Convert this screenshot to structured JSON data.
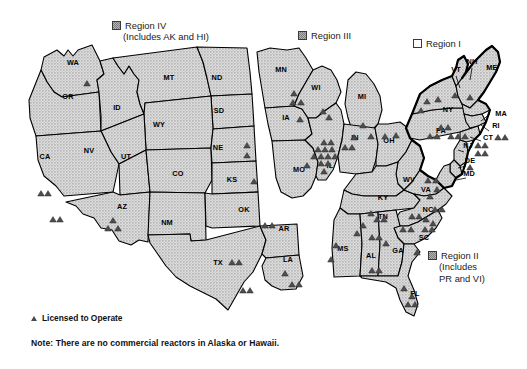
{
  "regions": [
    {
      "id": "region-iv",
      "name": "Region IV",
      "sub": "(Includes AK and HI)",
      "swatch": "filled",
      "x": 112,
      "y": 20
    },
    {
      "id": "region-iii",
      "name": "Region III",
      "sub": "",
      "swatch": "filled",
      "x": 298,
      "y": 30
    },
    {
      "id": "region-i",
      "name": "Region I",
      "sub": "",
      "swatch": "open",
      "x": 413,
      "y": 38
    },
    {
      "id": "region-ii",
      "name": "Region II",
      "sub": "(Includes|PR and VI)",
      "swatch": "filled",
      "x": 428,
      "y": 250
    }
  ],
  "legend": {
    "marker_symbol": "triangle",
    "marker_label": "Licensed to Operate",
    "note": "Note: There are no commercial reactors in Alaska or Hawaii."
  },
  "map_data": {
    "type": "choropleth-point-map",
    "marker_meaning": "Licensed to Operate",
    "state_labels": [
      {
        "abbr": "WA",
        "x": 73,
        "y": 65
      },
      {
        "abbr": "OR",
        "x": 68,
        "y": 99
      },
      {
        "abbr": "ID",
        "x": 117,
        "y": 110
      },
      {
        "abbr": "MT",
        "x": 169,
        "y": 80
      },
      {
        "abbr": "ND",
        "x": 217,
        "y": 80
      },
      {
        "abbr": "SD",
        "x": 219,
        "y": 113
      },
      {
        "abbr": "WY",
        "x": 159,
        "y": 127
      },
      {
        "abbr": "NV",
        "x": 89,
        "y": 153
      },
      {
        "abbr": "UT",
        "x": 126,
        "y": 159
      },
      {
        "abbr": "CO",
        "x": 178,
        "y": 176
      },
      {
        "abbr": "NE",
        "x": 218,
        "y": 150
      },
      {
        "abbr": "KS",
        "x": 232,
        "y": 182
      },
      {
        "abbr": "CA",
        "x": 45,
        "y": 159
      },
      {
        "abbr": "AZ",
        "x": 122,
        "y": 209
      },
      {
        "abbr": "NM",
        "x": 167,
        "y": 225
      },
      {
        "abbr": "OK",
        "x": 244,
        "y": 212
      },
      {
        "abbr": "TX",
        "x": 218,
        "y": 265
      },
      {
        "abbr": "AR",
        "x": 284,
        "y": 231
      },
      {
        "abbr": "LA",
        "x": 288,
        "y": 262
      },
      {
        "abbr": "MN",
        "x": 281,
        "y": 72
      },
      {
        "abbr": "IA",
        "x": 286,
        "y": 120
      },
      {
        "abbr": "MO",
        "x": 299,
        "y": 172
      },
      {
        "abbr": "WI",
        "x": 316,
        "y": 90
      },
      {
        "abbr": "IL",
        "x": 330,
        "y": 168
      },
      {
        "abbr": "MI",
        "x": 362,
        "y": 99
      },
      {
        "abbr": "IN",
        "x": 355,
        "y": 140
      },
      {
        "abbr": "OH",
        "x": 389,
        "y": 143
      },
      {
        "abbr": "KY",
        "x": 383,
        "y": 200
      },
      {
        "abbr": "TN",
        "x": 383,
        "y": 219
      },
      {
        "abbr": "MS",
        "x": 343,
        "y": 251
      },
      {
        "abbr": "AL",
        "x": 371,
        "y": 258
      },
      {
        "abbr": "GA",
        "x": 398,
        "y": 253
      },
      {
        "abbr": "FL",
        "x": 415,
        "y": 296
      },
      {
        "abbr": "SC",
        "x": 424,
        "y": 240
      },
      {
        "abbr": "NC",
        "x": 428,
        "y": 212
      },
      {
        "abbr": "VA",
        "x": 426,
        "y": 192
      },
      {
        "abbr": "WV",
        "x": 409,
        "y": 182
      },
      {
        "abbr": "MD",
        "x": 469,
        "y": 176
      },
      {
        "abbr": "DE",
        "x": 470,
        "y": 163
      },
      {
        "abbr": "NJ",
        "x": 468,
        "y": 148
      },
      {
        "abbr": "PA",
        "x": 441,
        "y": 133
      },
      {
        "abbr": "NY",
        "x": 448,
        "y": 112
      },
      {
        "abbr": "CT",
        "x": 488,
        "y": 140
      },
      {
        "abbr": "RI",
        "x": 496,
        "y": 128
      },
      {
        "abbr": "MA",
        "x": 501,
        "y": 116
      },
      {
        "abbr": "VT",
        "x": 456,
        "y": 72
      },
      {
        "abbr": "NH",
        "x": 472,
        "y": 64
      },
      {
        "abbr": "ME",
        "x": 492,
        "y": 70
      }
    ],
    "reactor_markers": [
      {
        "x": 87,
        "y": 86
      },
      {
        "x": 41,
        "y": 196
      },
      {
        "x": 48,
        "y": 196
      },
      {
        "x": 53,
        "y": 222
      },
      {
        "x": 60,
        "y": 222
      },
      {
        "x": 113,
        "y": 223
      },
      {
        "x": 108,
        "y": 231
      },
      {
        "x": 118,
        "y": 231
      },
      {
        "x": 247,
        "y": 148
      },
      {
        "x": 247,
        "y": 158
      },
      {
        "x": 254,
        "y": 184
      },
      {
        "x": 294,
        "y": 96
      },
      {
        "x": 293,
        "y": 105
      },
      {
        "x": 301,
        "y": 105
      },
      {
        "x": 300,
        "y": 122
      },
      {
        "x": 307,
        "y": 168
      },
      {
        "x": 323,
        "y": 114
      },
      {
        "x": 329,
        "y": 120
      },
      {
        "x": 324,
        "y": 145
      },
      {
        "x": 331,
        "y": 145
      },
      {
        "x": 318,
        "y": 152
      },
      {
        "x": 325,
        "y": 152
      },
      {
        "x": 332,
        "y": 152
      },
      {
        "x": 314,
        "y": 159
      },
      {
        "x": 321,
        "y": 159
      },
      {
        "x": 328,
        "y": 159
      },
      {
        "x": 335,
        "y": 159
      },
      {
        "x": 321,
        "y": 166
      },
      {
        "x": 328,
        "y": 166
      },
      {
        "x": 324,
        "y": 174
      },
      {
        "x": 345,
        "y": 150
      },
      {
        "x": 352,
        "y": 150
      },
      {
        "x": 363,
        "y": 128
      },
      {
        "x": 354,
        "y": 140
      },
      {
        "x": 371,
        "y": 139
      },
      {
        "x": 385,
        "y": 139
      },
      {
        "x": 396,
        "y": 138
      },
      {
        "x": 371,
        "y": 216
      },
      {
        "x": 377,
        "y": 222
      },
      {
        "x": 384,
        "y": 222
      },
      {
        "x": 363,
        "y": 228
      },
      {
        "x": 357,
        "y": 236
      },
      {
        "x": 336,
        "y": 248
      },
      {
        "x": 331,
        "y": 262
      },
      {
        "x": 372,
        "y": 240
      },
      {
        "x": 379,
        "y": 240
      },
      {
        "x": 386,
        "y": 246
      },
      {
        "x": 372,
        "y": 273
      },
      {
        "x": 379,
        "y": 273
      },
      {
        "x": 403,
        "y": 232
      },
      {
        "x": 411,
        "y": 232
      },
      {
        "x": 417,
        "y": 255
      },
      {
        "x": 412,
        "y": 219
      },
      {
        "x": 419,
        "y": 219
      },
      {
        "x": 426,
        "y": 222
      },
      {
        "x": 433,
        "y": 226
      },
      {
        "x": 425,
        "y": 232
      },
      {
        "x": 432,
        "y": 232
      },
      {
        "x": 435,
        "y": 212
      },
      {
        "x": 442,
        "y": 212
      },
      {
        "x": 430,
        "y": 199
      },
      {
        "x": 437,
        "y": 192
      },
      {
        "x": 428,
        "y": 183
      },
      {
        "x": 436,
        "y": 183
      },
      {
        "x": 404,
        "y": 291
      },
      {
        "x": 412,
        "y": 299
      },
      {
        "x": 408,
        "y": 307
      },
      {
        "x": 415,
        "y": 307
      },
      {
        "x": 265,
        "y": 228
      },
      {
        "x": 272,
        "y": 228
      },
      {
        "x": 232,
        "y": 265
      },
      {
        "x": 239,
        "y": 265
      },
      {
        "x": 243,
        "y": 293
      },
      {
        "x": 250,
        "y": 293
      },
      {
        "x": 285,
        "y": 276
      },
      {
        "x": 292,
        "y": 287
      },
      {
        "x": 299,
        "y": 287
      },
      {
        "x": 427,
        "y": 104
      },
      {
        "x": 438,
        "y": 102
      },
      {
        "x": 421,
        "y": 113
      },
      {
        "x": 455,
        "y": 98
      },
      {
        "x": 470,
        "y": 100
      },
      {
        "x": 441,
        "y": 130
      },
      {
        "x": 448,
        "y": 130
      },
      {
        "x": 430,
        "y": 139
      },
      {
        "x": 437,
        "y": 139
      },
      {
        "x": 451,
        "y": 139
      },
      {
        "x": 458,
        "y": 139
      },
      {
        "x": 465,
        "y": 139
      },
      {
        "x": 498,
        "y": 140
      },
      {
        "x": 505,
        "y": 140
      },
      {
        "x": 478,
        "y": 148
      },
      {
        "x": 485,
        "y": 148
      },
      {
        "x": 478,
        "y": 156
      },
      {
        "x": 485,
        "y": 156
      },
      {
        "x": 470,
        "y": 170
      }
    ]
  }
}
